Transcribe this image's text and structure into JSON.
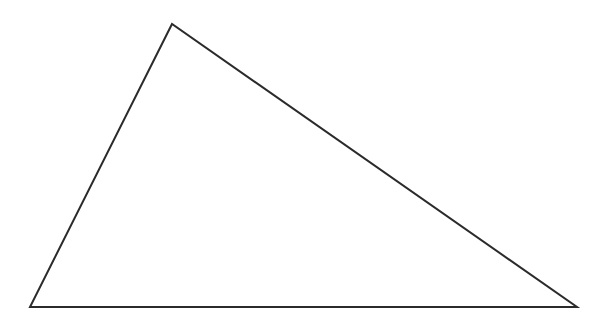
{
  "diagram": {
    "type": "triangle",
    "background": "#ffffff",
    "stroke": "#2b2b2b",
    "stroke_width": 2,
    "fill": "none",
    "vertices": [
      {
        "name": "apex",
        "x": 172,
        "y": 24
      },
      {
        "name": "bottom-left",
        "x": 30,
        "y": 307
      },
      {
        "name": "bottom-right",
        "x": 577,
        "y": 307
      }
    ]
  }
}
